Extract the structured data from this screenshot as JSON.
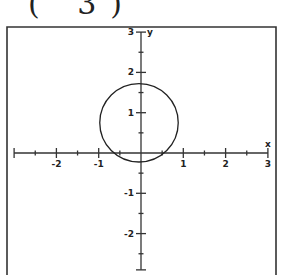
{
  "caption": "( 3)",
  "chart_data": {
    "type": "line",
    "title": "",
    "xlabel": "x",
    "ylabel": "y",
    "xlim": [
      -3,
      3
    ],
    "ylim": [
      -2.9,
      3
    ],
    "x_ticks": [
      -2,
      -1,
      1,
      2,
      3
    ],
    "y_ticks": [
      3,
      2,
      1,
      -1,
      -2
    ],
    "x_tick_labels": [
      "-2",
      "-1",
      "1",
      "2",
      "3"
    ],
    "y_tick_labels": [
      "3",
      "2",
      "1",
      "-1",
      "-2"
    ],
    "minor_tick_step": 0.5,
    "grid": false,
    "legend": null,
    "series": [
      {
        "name": "circle",
        "shape": "circle",
        "center": [
          0,
          0.75
        ],
        "radius": 0.95
      }
    ],
    "color": "#222222"
  }
}
